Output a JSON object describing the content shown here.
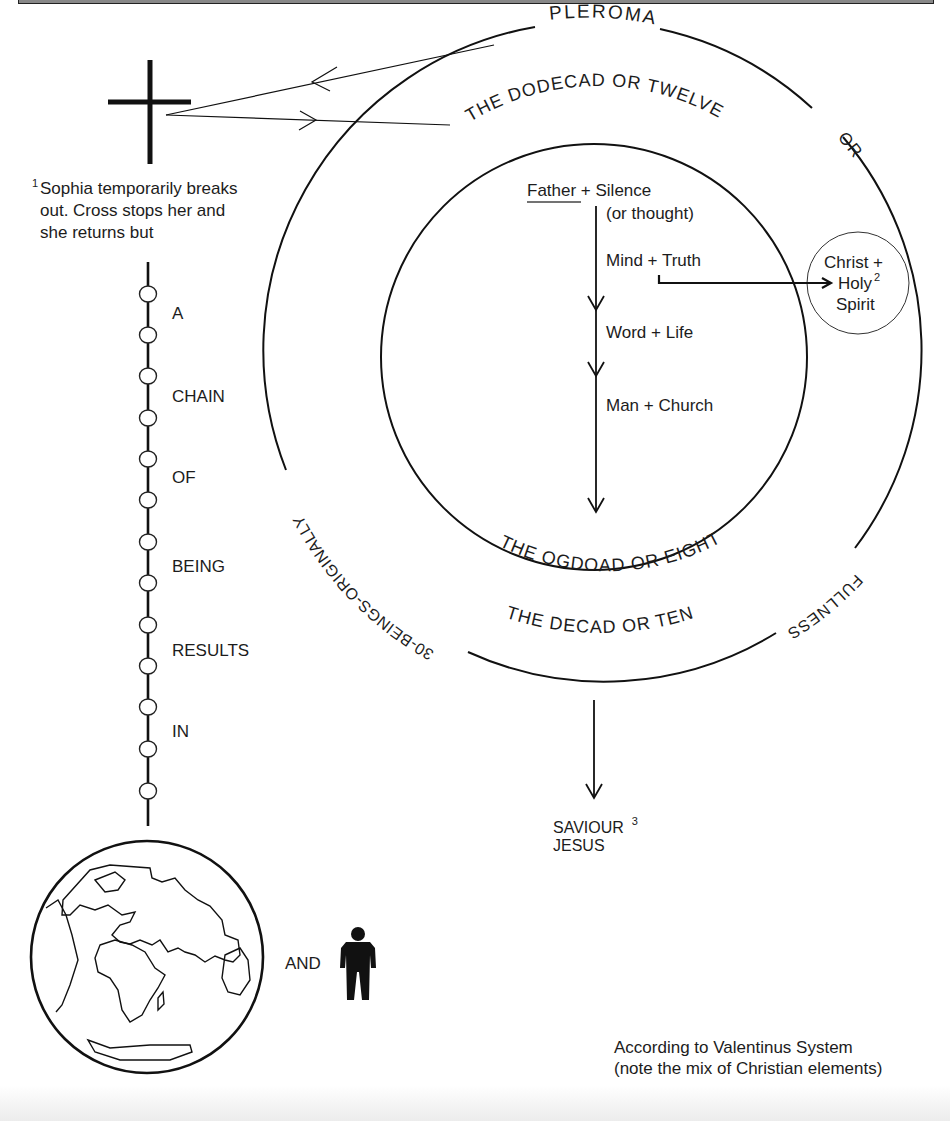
{
  "diagram": {
    "outer_ring": {
      "label_top": "PLEROMA",
      "label_right": "OR",
      "label_lower_right": "FULLNESS",
      "label_lower_left": "30-BEINGS-ORIGINALLY"
    },
    "middle_ring_labels": {
      "top": "THE DODECAD OR TWELVE",
      "bottom": "THE DECAD OR TEN"
    },
    "inner_ring_label": "THE OGDOAD OR EIGHT",
    "emanations": [
      {
        "pair": "Father + Silence",
        "underlined": "Father"
      },
      {
        "pair": "(or thought)"
      },
      {
        "pair": "Mind + Truth"
      },
      {
        "pair": "Word + Life"
      },
      {
        "pair": "Man + Church"
      }
    ],
    "christ_circle": {
      "line1": "Christ +",
      "line2": "Holy",
      "line3": "Spirit",
      "footnote": "2"
    },
    "saviour": {
      "line1": "SAVIOUR",
      "line2": "JESUS",
      "footnote": "3"
    },
    "sophia_note": {
      "footnote": "1",
      "lines": [
        "Sophia temporarily breaks",
        "out. Cross stops her and",
        "she returns but"
      ]
    },
    "chain": {
      "words": [
        "A",
        "CHAIN",
        "OF",
        "BEING",
        "RESULTS",
        "IN"
      ],
      "bead_count": 13
    },
    "result": {
      "conjunction": "AND"
    },
    "caption": {
      "line1": "According to Valentinus System",
      "line2": "(note the mix of Christian elements)"
    },
    "icons": [
      "cross-icon",
      "globe-icon",
      "person-icon"
    ]
  }
}
